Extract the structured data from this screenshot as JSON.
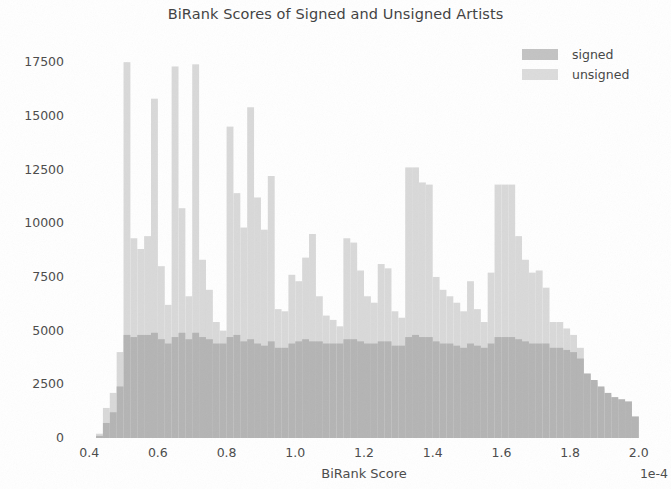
{
  "chart_data": {
    "type": "bar",
    "subtype": "histogram-overlapping",
    "title": "BiRank Scores of Signed and Unsigned Artists",
    "xlabel": "BiRank Score",
    "ylabel": "Artists",
    "x_exponent_label": "1e-4",
    "xlim": [
      0.35,
      2.05
    ],
    "ylim": [
      0,
      18300
    ],
    "grid": false,
    "legend_position": "upper right",
    "x_ticks": [
      "0.4",
      "0.6",
      "0.8",
      "1.0",
      "1.2",
      "1.4",
      "1.6",
      "1.8",
      "2.0"
    ],
    "x_tick_values": [
      0.4,
      0.6,
      0.8,
      1.0,
      1.2,
      1.4,
      1.6,
      1.8,
      2.0
    ],
    "y_ticks": [
      "0",
      "2500",
      "5000",
      "7500",
      "10000",
      "12500",
      "15000",
      "17500"
    ],
    "y_tick_values": [
      0,
      2500,
      5000,
      7500,
      10000,
      12500,
      15000,
      17500
    ],
    "colors": {
      "signed": "#b4b4b4",
      "unsigned": "#d9d9d9",
      "background": "#ffffff",
      "text": "#4a4a4a"
    },
    "bin_width": 0.02,
    "bin_starts": [
      0.4,
      0.42,
      0.44,
      0.46,
      0.48,
      0.5,
      0.52,
      0.54,
      0.56,
      0.58,
      0.6,
      0.62,
      0.64,
      0.66,
      0.68,
      0.7,
      0.72,
      0.74,
      0.76,
      0.78,
      0.8,
      0.82,
      0.84,
      0.86,
      0.88,
      0.9,
      0.92,
      0.94,
      0.96,
      0.98,
      1.0,
      1.02,
      1.04,
      1.06,
      1.08,
      1.1,
      1.12,
      1.14,
      1.16,
      1.18,
      1.2,
      1.22,
      1.24,
      1.26,
      1.28,
      1.3,
      1.32,
      1.34,
      1.36,
      1.38,
      1.4,
      1.42,
      1.44,
      1.46,
      1.48,
      1.5,
      1.52,
      1.54,
      1.56,
      1.58,
      1.6,
      1.62,
      1.64,
      1.66,
      1.68,
      1.7,
      1.72,
      1.74,
      1.76,
      1.78,
      1.8,
      1.82,
      1.84,
      1.86,
      1.88,
      1.9,
      1.92,
      1.94,
      1.96,
      1.98
    ],
    "series": [
      {
        "name": "unsigned",
        "color": "#d9d9d9",
        "values": [
          0,
          200,
          1400,
          2100,
          4000,
          17500,
          9300,
          8800,
          9400,
          15800,
          8000,
          6200,
          17300,
          10700,
          6600,
          17400,
          8300,
          6900,
          5400,
          5000,
          14500,
          11400,
          9800,
          15400,
          11200,
          9700,
          12200,
          6000,
          5900,
          7600,
          7300,
          8400,
          9500,
          6600,
          5700,
          5500,
          5200,
          9300,
          9100,
          7800,
          6600,
          6300,
          8100,
          7900,
          5900,
          5600,
          12600,
          12600,
          11900,
          11800,
          7500,
          6900,
          6600,
          6300,
          5900,
          7300,
          6000,
          5400,
          7700,
          11800,
          11800,
          11800,
          9400,
          8300,
          7700,
          7800,
          7000,
          5400,
          5400,
          5100,
          4800,
          4200,
          3000,
          2600,
          2300,
          2000,
          1900,
          1800,
          1700,
          1000
        ]
      },
      {
        "name": "signed",
        "color": "#b4b4b4",
        "values": [
          0,
          100,
          700,
          1200,
          2400,
          4800,
          4700,
          4800,
          4800,
          4900,
          4600,
          4400,
          4700,
          4900,
          4600,
          4900,
          4700,
          4600,
          4400,
          4400,
          4700,
          4800,
          4500,
          4600,
          4400,
          4300,
          4500,
          4200,
          4200,
          4400,
          4500,
          4600,
          4500,
          4500,
          4400,
          4400,
          4400,
          4600,
          4600,
          4500,
          4400,
          4400,
          4500,
          4500,
          4300,
          4300,
          4700,
          4800,
          4700,
          4700,
          4500,
          4400,
          4400,
          4300,
          4200,
          4400,
          4300,
          4200,
          4400,
          4700,
          4700,
          4700,
          4600,
          4500,
          4400,
          4400,
          4400,
          4200,
          4200,
          4100,
          4000,
          3700,
          3000,
          2700,
          2400,
          2100,
          1900,
          1800,
          1700,
          1000
        ]
      }
    ]
  },
  "legend": {
    "items": [
      {
        "label": "signed",
        "color": "#c3c3c3"
      },
      {
        "label": "unsigned",
        "color": "#dcdcdc"
      }
    ]
  }
}
